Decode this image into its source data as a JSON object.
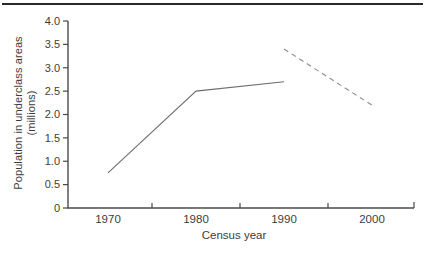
{
  "figure": {
    "y_axis_title_line1": "Population in underclass areas",
    "y_axis_title_line2": "(millions)",
    "x_axis_title": "Census year"
  },
  "chart_data": {
    "type": "line",
    "title": "",
    "xlabel": "Census year",
    "ylabel": "Population in underclass areas (millions)",
    "xlim": [
      1965.5,
      2004.7
    ],
    "ylim": [
      0,
      4.0
    ],
    "grid": false,
    "legend": "none",
    "x_tick_years": [
      1970,
      1980,
      1990,
      2000
    ],
    "x_tick_labels": [
      "1970",
      "1980",
      "1990",
      "2000"
    ],
    "x_minor_tick_years": [
      1975,
      1985,
      1995
    ],
    "y_ticks": [
      0,
      0.5,
      1.0,
      1.5,
      2.0,
      2.5,
      3.0,
      3.5,
      4.0
    ],
    "y_tick_labels": [
      "0",
      "0.5",
      "1.0",
      "1.5",
      "2.0",
      "2.5",
      "3.0",
      "3.5",
      "4.0"
    ],
    "series": [
      {
        "name": "observed",
        "style": "solid",
        "points": [
          {
            "x": 1970,
            "y": 0.75
          },
          {
            "x": 1980,
            "y": 2.5
          },
          {
            "x": 1990,
            "y": 2.7
          }
        ]
      },
      {
        "name": "projected",
        "style": "dashed",
        "points": [
          {
            "x": 1990,
            "y": 3.4
          },
          {
            "x": 2000,
            "y": 2.2
          }
        ]
      }
    ],
    "colors": {
      "line": "#6e6e6e",
      "dashed_line": "#8c8c8c",
      "axis": "#4a4a4a",
      "text": "#3d3d3d",
      "top_rule": "#2a2a2a"
    }
  }
}
